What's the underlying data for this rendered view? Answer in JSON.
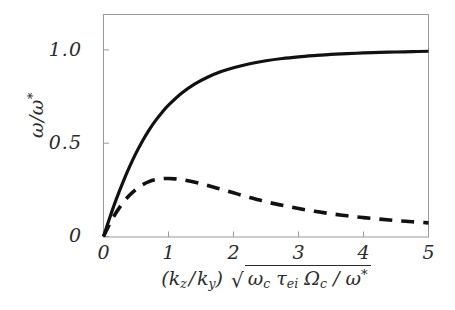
{
  "figure": {
    "background": "#ffffff",
    "frame_color": "#9a9a9a",
    "curve_color": "#111111"
  },
  "axes": {
    "y_label_parts": {
      "omega": "ω",
      "slash": "/",
      "omega_star_base": "ω",
      "star": "*"
    },
    "y_label_plain": "ω/ω*",
    "x_label_plain": "(k_z/k_y) √(ω_c τ_ei Ω_c / ω*)",
    "x_label_parts": {
      "open_paren": "(",
      "k1": "k",
      "k1_sub": "z",
      "divide": "/",
      "k2": "k",
      "k2_sub": "y",
      "close_paren": ")",
      "radical": "√",
      "omega_c": "ω",
      "omega_c_sub": "c",
      "tau": "τ",
      "tau_sub": "ei",
      "Omega_c": "Ω",
      "Omega_c_sub": "c",
      "inner_divide": "/",
      "omega_star": "ω",
      "star": "*"
    },
    "x_ticks": [
      "0",
      "1",
      "2",
      "3",
      "4",
      "5"
    ],
    "y_ticks": [
      "0",
      "0.5",
      "1.0"
    ]
  },
  "chart_data": {
    "type": "line",
    "title": "",
    "xlabel": "(k_z/k_y) sqrt(omega_c tau_ei Omega_c / omega*)",
    "ylabel": "omega/omega*",
    "xlim": [
      0,
      5
    ],
    "ylim": [
      0,
      1.19
    ],
    "xticks": [
      0,
      1,
      2,
      3,
      4,
      5
    ],
    "yticks": [
      0,
      0.5,
      1.0
    ],
    "grid": false,
    "legend": "none",
    "series": [
      {
        "name": "real frequency",
        "style": "solid",
        "color": "#111111",
        "x": [
          0,
          0.1,
          0.2,
          0.3,
          0.4,
          0.5,
          0.6,
          0.7,
          0.8,
          0.9,
          1.0,
          1.2,
          1.4,
          1.6,
          1.8,
          2.0,
          2.25,
          2.5,
          2.75,
          3.0,
          3.25,
          3.5,
          3.75,
          4.0,
          4.25,
          4.5,
          4.75,
          5.0
        ],
        "y": [
          0.0,
          0.105,
          0.203,
          0.292,
          0.373,
          0.447,
          0.512,
          0.57,
          0.621,
          0.665,
          0.704,
          0.768,
          0.817,
          0.854,
          0.883,
          0.905,
          0.926,
          0.942,
          0.954,
          0.963,
          0.97,
          0.976,
          0.98,
          0.984,
          0.987,
          0.989,
          0.991,
          0.993
        ]
      },
      {
        "name": "growth rate",
        "style": "dashed",
        "color": "#111111",
        "x": [
          0,
          0.1,
          0.2,
          0.3,
          0.4,
          0.5,
          0.6,
          0.7,
          0.8,
          0.9,
          1.0,
          1.1,
          1.25,
          1.5,
          1.75,
          2.0,
          2.25,
          2.5,
          2.75,
          3.0,
          3.25,
          3.5,
          3.75,
          4.0,
          4.25,
          4.5,
          4.75,
          5.0
        ],
        "y": [
          0.0,
          0.071,
          0.131,
          0.181,
          0.221,
          0.253,
          0.277,
          0.294,
          0.305,
          0.31,
          0.311,
          0.309,
          0.302,
          0.283,
          0.259,
          0.234,
          0.209,
          0.186,
          0.167,
          0.15,
          0.135,
          0.122,
          0.111,
          0.101,
          0.093,
          0.085,
          0.079,
          0.073
        ]
      }
    ]
  }
}
